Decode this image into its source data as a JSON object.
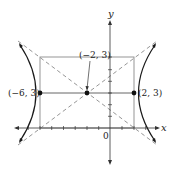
{
  "diagram": {
    "type": "hyperbola",
    "axes": {
      "x_label": "x",
      "y_label": "y",
      "origin_label": "0"
    },
    "points": [
      {
        "name": "center",
        "label": "(−2, 3)",
        "x": -2,
        "y": 3
      },
      {
        "name": "left-vertex",
        "label": "(−6, 3)",
        "x": -6,
        "y": 3
      },
      {
        "name": "right-vertex",
        "label": "(2, 3)",
        "x": 2,
        "y": 3
      }
    ],
    "elements": {
      "central_rectangle": "box from x=-6 to 2, y=0 to 6",
      "asymptotes": "two dashed diagonal lines through center",
      "branches": "two hyperbola branches opening left and right"
    },
    "colors": {
      "curve": "#1a1a1a",
      "axis": "#333333",
      "rectangle": "#8a8a8a",
      "asymptote": "#8a8a8a"
    }
  }
}
